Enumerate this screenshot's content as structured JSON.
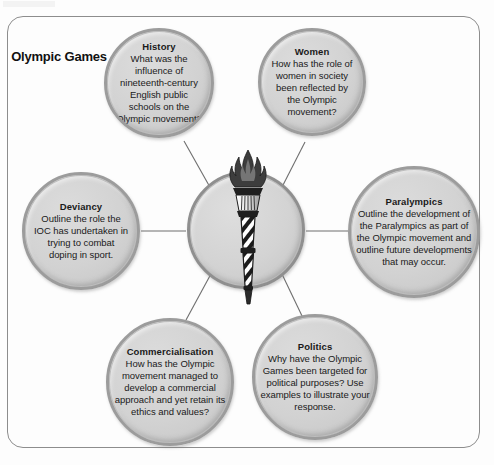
{
  "diagram": {
    "type": "mind-map",
    "centre": {
      "label": "Olympic Games",
      "icon": "olympic-torch-icon"
    },
    "frame": {
      "shape": "rounded-rectangle",
      "border_color": "#8d8d8d"
    },
    "colors": {
      "bubble_fill": "#d2d2d2",
      "bubble_border": "#9c9c9c",
      "text": "#1a1a1a",
      "connector": "#6f6f6f",
      "page_background": "#ffffff"
    },
    "nodes": [
      {
        "id": "history",
        "title": "History",
        "body": "What was the influence of nineteenth-century English public schools on the Olympic movement?"
      },
      {
        "id": "women",
        "title": "Women",
        "body": "How has the role of women in society been reflected by the Olympic movement?"
      },
      {
        "id": "deviancy",
        "title": "Deviancy",
        "body": "Outline the role the IOC has undertaken in trying to combat doping in sport."
      },
      {
        "id": "paralympics",
        "title": "Paralympics",
        "body": "Outline the development of the Paralympics as part of the Olympic movement and outline future developments that may occur."
      },
      {
        "id": "commercialisation",
        "title": "Commercialisation",
        "body": "How has the Olympic movement managed to develop a commercial approach and yet retain its ethics and values?"
      },
      {
        "id": "politics",
        "title": "Politics",
        "body": "Why have the Olympic Games been targeted for political purposes? Use examples to illustrate your response."
      }
    ]
  }
}
